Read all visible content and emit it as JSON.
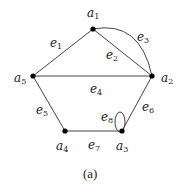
{
  "figure": {
    "caption": "(a)",
    "nodes": [
      {
        "id": "a1",
        "base": "a",
        "sub": "1",
        "x": 93,
        "y": 29,
        "lx": 87,
        "ly": 17
      },
      {
        "id": "a2",
        "base": "a",
        "sub": "2",
        "x": 152,
        "y": 76,
        "lx": 161,
        "ly": 82
      },
      {
        "id": "a3",
        "base": "a",
        "sub": "3",
        "x": 122,
        "y": 131,
        "lx": 116,
        "ly": 150
      },
      {
        "id": "a4",
        "base": "a",
        "sub": "4",
        "x": 65,
        "y": 131,
        "lx": 56,
        "ly": 150
      },
      {
        "id": "a5",
        "base": "a",
        "sub": "5",
        "x": 33,
        "y": 76,
        "lx": 14,
        "ly": 82
      }
    ],
    "edges": [
      {
        "id": "e1",
        "base": "e",
        "sub": "1",
        "from": "a5",
        "to": "a1",
        "lx": 50,
        "ly": 47
      },
      {
        "id": "e2",
        "base": "e",
        "sub": "2",
        "from": "a1",
        "to": "a2",
        "lx": 106,
        "ly": 59
      },
      {
        "id": "e3",
        "base": "e",
        "sub": "3",
        "from": "a1",
        "to": "a2",
        "curved": true,
        "lx": 137,
        "ly": 41
      },
      {
        "id": "e4",
        "base": "e",
        "sub": "4",
        "from": "a5",
        "to": "a2",
        "lx": 90,
        "ly": 93
      },
      {
        "id": "e5",
        "base": "e",
        "sub": "5",
        "from": "a5",
        "to": "a4",
        "lx": 36,
        "ly": 114
      },
      {
        "id": "e6",
        "base": "e",
        "sub": "6",
        "from": "a2",
        "to": "a3",
        "lx": 142,
        "ly": 111
      },
      {
        "id": "e7",
        "base": "e",
        "sub": "7",
        "from": "a4",
        "to": "a3",
        "lx": 88,
        "ly": 149
      },
      {
        "id": "e8",
        "base": "e",
        "sub": "8",
        "from": "a3",
        "to": "a3",
        "loop": true,
        "lx": 101,
        "ly": 121
      }
    ]
  }
}
